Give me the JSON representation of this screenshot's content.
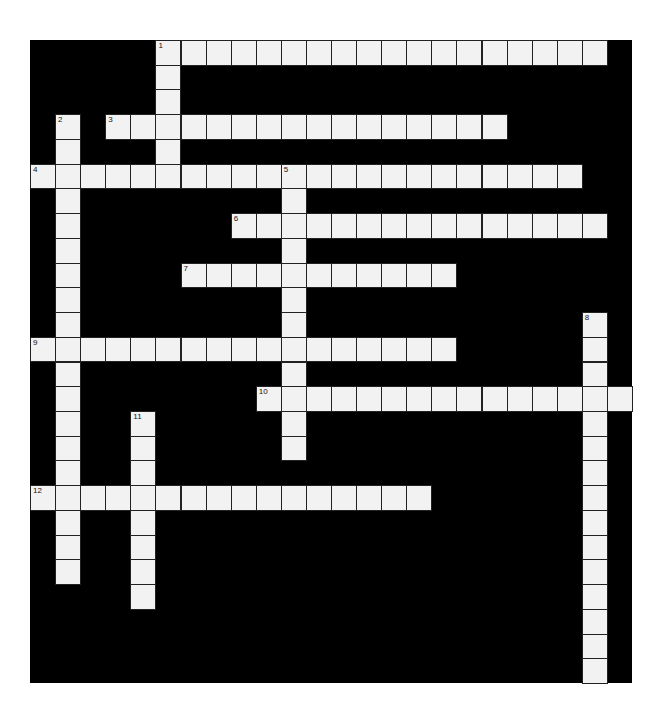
{
  "puzzle": {
    "cols": 24,
    "rows": 26,
    "colors": {
      "block": "#000000",
      "cell": "#f2f2f2",
      "background": "#ffffff"
    },
    "entries": [
      {
        "number": "1",
        "dir": "across",
        "row": 0,
        "col": 5,
        "length": 18
      },
      {
        "number": "1",
        "dir": "down",
        "row": 0,
        "col": 5,
        "length": 6
      },
      {
        "number": "2",
        "dir": "down",
        "row": 3,
        "col": 1,
        "length": 19
      },
      {
        "number": "3",
        "dir": "across",
        "row": 3,
        "col": 3,
        "length": 16
      },
      {
        "number": "4",
        "dir": "across",
        "row": 5,
        "col": 0,
        "length": 22
      },
      {
        "number": "5",
        "dir": "down",
        "row": 5,
        "col": 10,
        "length": 12
      },
      {
        "number": "6",
        "dir": "across",
        "row": 7,
        "col": 8,
        "length": 15
      },
      {
        "number": "7",
        "dir": "across",
        "row": 9,
        "col": 6,
        "length": 11
      },
      {
        "number": "8",
        "dir": "down",
        "row": 11,
        "col": 22,
        "length": 15
      },
      {
        "number": "9",
        "dir": "across",
        "row": 12,
        "col": 0,
        "length": 17
      },
      {
        "number": "10",
        "dir": "across",
        "row": 14,
        "col": 9,
        "length": 15
      },
      {
        "number": "11",
        "dir": "down",
        "row": 15,
        "col": 4,
        "length": 8
      },
      {
        "number": "12",
        "dir": "across",
        "row": 18,
        "col": 0,
        "length": 16
      }
    ]
  }
}
